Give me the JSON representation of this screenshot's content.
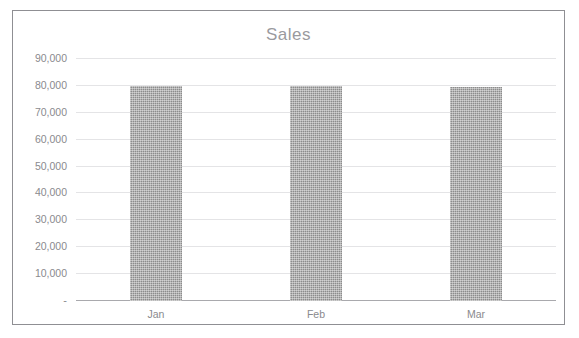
{
  "chart_data": {
    "type": "bar",
    "title": "Sales",
    "categories": [
      "Jan",
      "Feb",
      "Mar"
    ],
    "values": [
      80000,
      80000,
      79600
    ],
    "series": [
      {
        "name": "Sales",
        "values": [
          80000,
          80000,
          79600
        ]
      }
    ],
    "xlabel": "",
    "ylabel": "",
    "ylim": [
      0,
      90000
    ],
    "ytick_labels": [
      "90,000",
      "80,000",
      "70,000",
      "60,000",
      "50,000",
      "40,000",
      "30,000",
      "20,000",
      "10,000",
      "-"
    ],
    "ytick_values": [
      90000,
      80000,
      70000,
      60000,
      50000,
      40000,
      30000,
      20000,
      10000,
      0
    ],
    "grid": true,
    "legend": false,
    "legend_position": "none",
    "bar_color": "#8c8c8c",
    "grid_color": "#e4e4e6",
    "axis_color": "#a9a9ad",
    "text_color": "#8a8a8e",
    "title_color": "#9a9a9e",
    "background_color": "#ffffff",
    "border_color": "#8f8f93"
  }
}
